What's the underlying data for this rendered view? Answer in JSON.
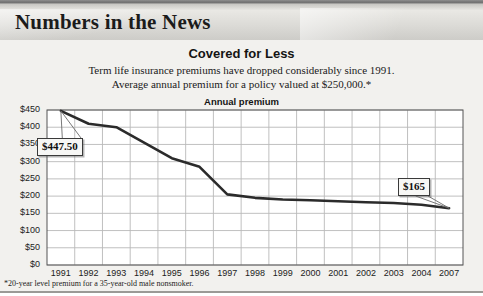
{
  "banner": {
    "title": "Numbers in the News"
  },
  "header": {
    "title": "Covered for Less",
    "subtitle_line1": "Term life insurance premiums have dropped considerably since 1991.",
    "subtitle_line2": "Average annual premium for a policy valued at $250,000.*",
    "axis_heading": "Annual premium"
  },
  "footnote": "*20-year level premium for a 35-year-old male nonsmoker.",
  "callouts": [
    {
      "label": "$447.50",
      "value": 447.5,
      "points_to_year": "1991"
    },
    {
      "label": "$165",
      "value": 165,
      "points_to_year": "2007"
    }
  ],
  "colors": {
    "line": "#2b2b2b",
    "plot_background": "#ffffff",
    "grid": "#b9b9b9",
    "axis": "#4a4a4a",
    "page_background": "#f2f1ee",
    "banner_text": "#1b1b1b"
  },
  "chart_data": {
    "type": "line",
    "title": "Covered for Less",
    "subtitle": "Term life insurance premiums have dropped considerably since 1991. Average annual premium for a policy valued at $250,000.*",
    "xlabel": "",
    "ylabel": "Annual premium",
    "ylim": [
      0,
      450
    ],
    "yticks": [
      0,
      50,
      100,
      150,
      200,
      250,
      300,
      350,
      400,
      450
    ],
    "ytick_labels": [
      "$0",
      "$50",
      "$100",
      "$150",
      "$200",
      "$250",
      "$300",
      "$350",
      "$400",
      "$450"
    ],
    "grid": true,
    "legend": false,
    "categories": [
      "1991",
      "1992",
      "1993",
      "1994",
      "1995",
      "1996",
      "1997",
      "1998",
      "1999",
      "2000",
      "2001",
      "2002",
      "2003",
      "2004",
      "2007"
    ],
    "values": [
      447.5,
      410,
      400,
      355,
      310,
      285,
      205,
      195,
      190,
      188,
      185,
      182,
      180,
      175,
      165
    ],
    "annotations": [
      {
        "text": "$447.50",
        "x": "1991",
        "y": 447.5
      },
      {
        "text": "$165",
        "x": "2007",
        "y": 165
      }
    ]
  }
}
